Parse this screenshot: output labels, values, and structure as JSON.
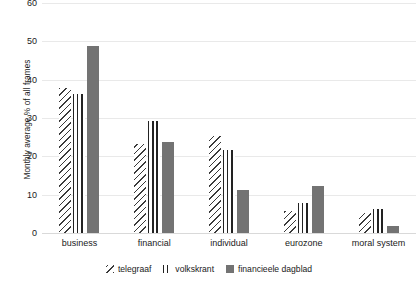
{
  "chart_data": {
    "type": "bar",
    "title": "",
    "subtitle": "",
    "xlabel": "",
    "ylabel": "Monthly average % of all frames",
    "categories": [
      "business",
      "financial",
      "individual",
      "eurozone",
      "moral system"
    ],
    "series": [
      {
        "name": "telegraaf",
        "values": [
          38,
          23.5,
          25.5,
          6,
          5.5
        ],
        "marker": "diagonal-hatch",
        "color": "#3a3a3a"
      },
      {
        "name": "volkskrant",
        "values": [
          36.5,
          29.5,
          22,
          8,
          6.5
        ],
        "marker": "vertical-lines",
        "color": "#222222"
      },
      {
        "name": "financieele dagblad",
        "values": [
          49,
          24,
          11.5,
          12.5,
          2
        ],
        "marker": "solid-fill",
        "color": "#737373"
      }
    ],
    "ylim": [
      0,
      60
    ],
    "yticks": [
      0,
      10,
      20,
      30,
      40,
      50,
      60
    ],
    "ytick_labels": [
      "0",
      "10",
      "20",
      "30",
      "40",
      "50",
      "60"
    ],
    "grid": true,
    "grid_color": "#e9e9e9",
    "legend_position": "bottom",
    "background": "#ffffff"
  }
}
